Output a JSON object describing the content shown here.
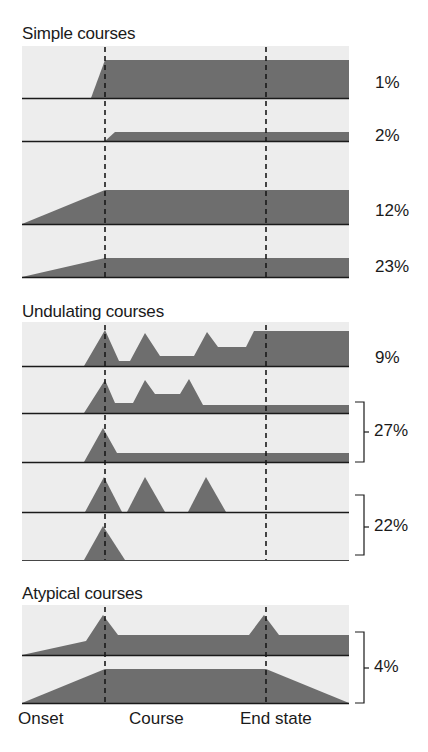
{
  "sections": [
    {
      "title": "Simple courses",
      "labels": [
        "1%",
        "2%",
        "12%",
        "23%"
      ]
    },
    {
      "title": "Undulating courses",
      "labels": [
        "9%",
        "27%",
        "22%"
      ]
    },
    {
      "title": "Atypical courses",
      "labels": [
        "4%"
      ]
    }
  ],
  "axis": {
    "onset": "Onset",
    "course": "Course",
    "end_state": "End state"
  },
  "colors": {
    "panel_bg": "#ededed",
    "fill": "#6e6e6e",
    "line": "#1a1a1a"
  }
}
